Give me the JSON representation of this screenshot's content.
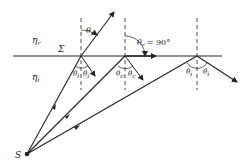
{
  "diagram": {
    "labels": {
      "upper_medium": "η",
      "upper_medium_sub": "r",
      "lower_medium": "η",
      "lower_medium_sub": "i",
      "interface": "Σ",
      "source": "S",
      "theta": "θ",
      "sub_r": "r",
      "sub_i": "i",
      "sub_c": "c",
      "theta_r_90": "= 90°"
    },
    "colors": {
      "line": "#222222",
      "background": "#ffffff"
    },
    "geometry": {
      "interface_y": 56,
      "source": [
        27,
        154
      ],
      "normals_x": [
        81,
        125,
        197
      ]
    }
  }
}
